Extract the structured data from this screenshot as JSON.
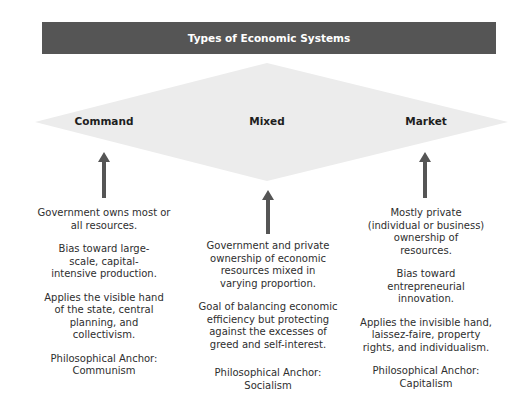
{
  "title": "Types of Economic Systems",
  "colors": {
    "banner": "#555555",
    "banner_text": "#ffffff",
    "diamond": "#ececec",
    "arrow": "#555555"
  },
  "systems": [
    {
      "name": "Command",
      "points": [
        "Government owns most or all resources.",
        "Bias toward large-scale, capital-intensive production.",
        "Applies the visible hand of the state, central planning, and collectivism.",
        "Philosophical Anchor: Communism"
      ]
    },
    {
      "name": "Mixed",
      "points": [
        "Government and private ownership of economic resources mixed in varying proportion.",
        "Goal of balancing economic efficiency but protecting against the excesses of greed and self-interest.",
        "Philosophical Anchor: Socialism"
      ]
    },
    {
      "name": "Market",
      "points": [
        "Mostly private (individual or business) ownership of resources.",
        "Bias toward entrepreneurial innovation.",
        "Applies the invisible hand, laissez-faire, property rights, and individualism.",
        "Philosophical Anchor: Capitalism"
      ]
    }
  ]
}
